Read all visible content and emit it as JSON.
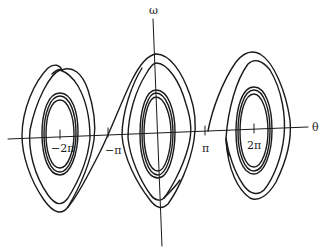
{
  "diagram": {
    "type": "phase-portrait",
    "axes": {
      "x_label": "θ",
      "y_label": "ω"
    },
    "ticks": [
      {
        "label": "−2π",
        "value": "-2pi"
      },
      {
        "label": "−π",
        "value": "-pi"
      },
      {
        "label": "π",
        "value": "pi"
      },
      {
        "label": "2π",
        "value": "2pi"
      }
    ],
    "centers": [
      "-2pi",
      "0",
      "2pi"
    ],
    "line_color": "#1a1a1a",
    "background": "#ffffff"
  }
}
